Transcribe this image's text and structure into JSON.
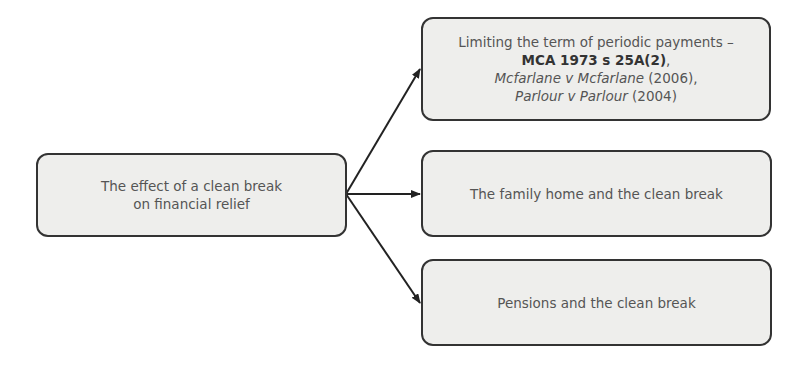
{
  "diagram": {
    "type": "flow-diagram",
    "root": {
      "id": "root",
      "lines": [
        "The effect of a clean break",
        "on financial relief"
      ]
    },
    "children": [
      {
        "id": "child-1",
        "line1": "Limiting the term of periodic payments –",
        "line2_bold": "MCA 1973  s 25A(2)",
        "line2_suffix": ",",
        "line3_ital": "Mcfarlane v Mcfarlane",
        "line3_suffix": " (2006),",
        "line4_ital": "Parlour v Parlour",
        "line4_suffix": " (2004)"
      },
      {
        "id": "child-2",
        "label": "The family home and the clean break"
      },
      {
        "id": "child-3",
        "label": "Pensions and the clean break"
      }
    ],
    "edges": [
      {
        "from": "root",
        "to": "child-1"
      },
      {
        "from": "root",
        "to": "child-2"
      },
      {
        "from": "root",
        "to": "child-3"
      }
    ],
    "colors": {
      "box_fill": "#eeeeec",
      "box_border": "#333333",
      "text": "#555555",
      "arrow": "#222222"
    }
  }
}
